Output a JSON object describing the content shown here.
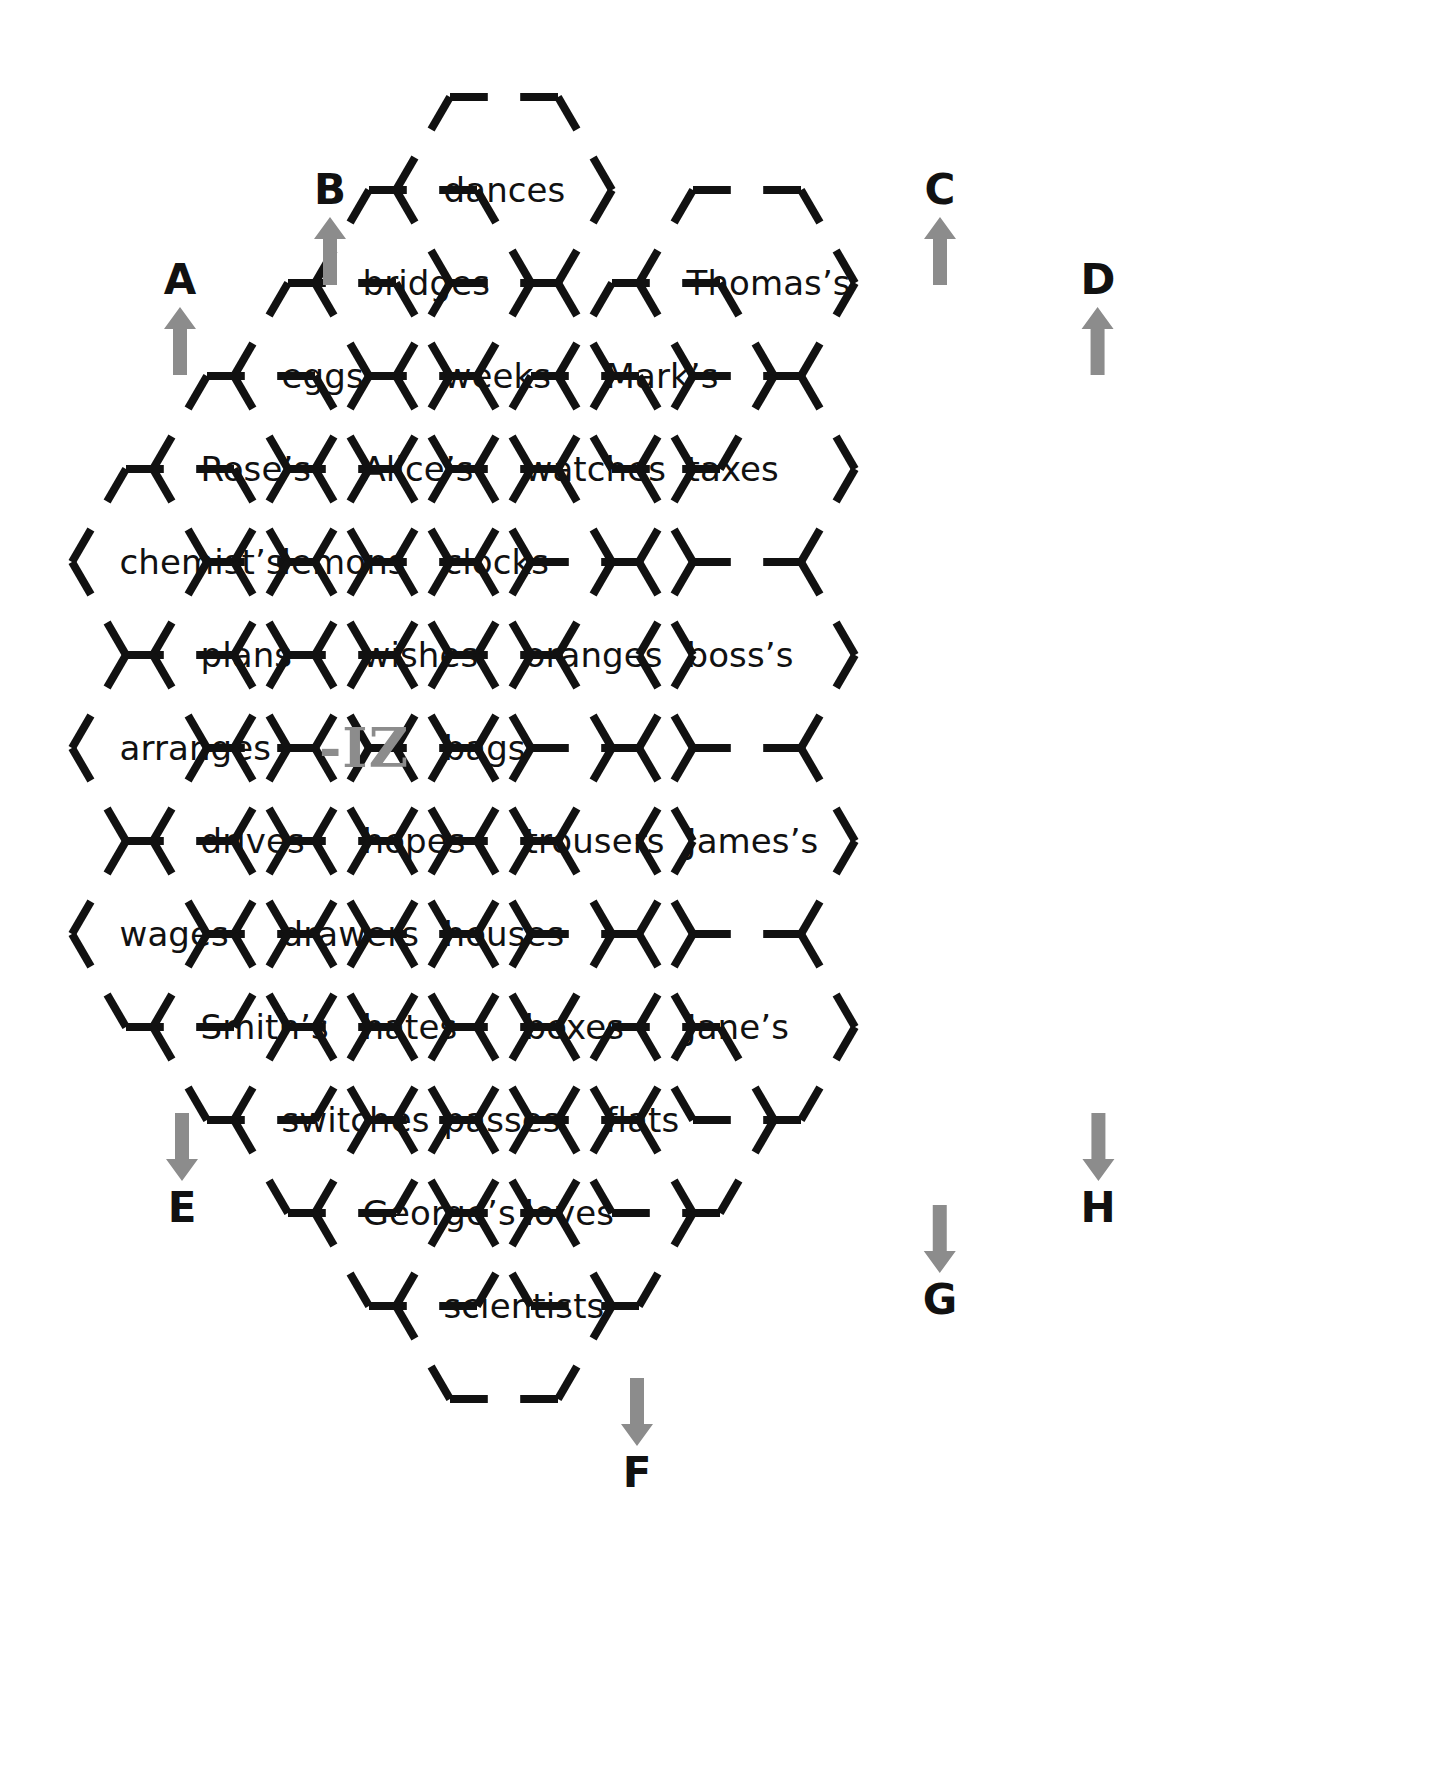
{
  "figure": {
    "kind": "honeycomb-word-puzzle",
    "center_label": "-IZ",
    "stroke_color": "#111111",
    "arrow_color": "#8c8c8c",
    "center_label_color": "#8c8c8c",
    "background_color": "#ffffff"
  },
  "cells": [
    {
      "id": "c-dances",
      "label": "dances",
      "col": 2,
      "row": 0
    },
    {
      "id": "c-bridges",
      "label": "bridges",
      "col": 1,
      "row": 1
    },
    {
      "id": "c-thomas",
      "label": "Thomas’s",
      "col": 3,
      "row": 1
    },
    {
      "id": "c-eggs",
      "label": "eggs",
      "col": 1,
      "row": 2
    },
    {
      "id": "c-weeks",
      "label": "weeks",
      "col": 2,
      "row": 2
    },
    {
      "id": "c-marks",
      "label": "Mark’s",
      "col": 3,
      "row": 2
    },
    {
      "id": "c-roses",
      "label": "Rose’s",
      "col": 0,
      "row": 3
    },
    {
      "id": "c-alices",
      "label": "Alice’s",
      "col": 1,
      "row": 3
    },
    {
      "id": "c-watches",
      "label": "watches",
      "col": 2,
      "row": 3
    },
    {
      "id": "c-taxes",
      "label": "taxes",
      "col": 3,
      "row": 3
    },
    {
      "id": "c-chemists",
      "label": "chemist’s",
      "col": 0,
      "row": 4
    },
    {
      "id": "c-lemons",
      "label": "lemons",
      "col": 1,
      "row": 4
    },
    {
      "id": "c-clocks",
      "label": "clocks",
      "col": 2,
      "row": 4
    },
    {
      "id": "c-plans",
      "label": "plans",
      "col": 0,
      "row": 5
    },
    {
      "id": "c-wishes",
      "label": "wishes",
      "col": 1,
      "row": 5
    },
    {
      "id": "c-oranges",
      "label": "oranges",
      "col": 2,
      "row": 5
    },
    {
      "id": "c-bosss",
      "label": "boss’s",
      "col": 3,
      "row": 5
    },
    {
      "id": "c-arranges",
      "label": "arranges",
      "col": 0,
      "row": 6
    },
    {
      "id": "c-iz",
      "label": "-IZ",
      "col": 1,
      "row": 6
    },
    {
      "id": "c-bags",
      "label": "bags",
      "col": 2,
      "row": 6
    },
    {
      "id": "c-drives",
      "label": "drives",
      "col": 0,
      "row": 7
    },
    {
      "id": "c-hopes",
      "label": "hopes",
      "col": 1,
      "row": 7
    },
    {
      "id": "c-trousers",
      "label": "trousers",
      "col": 2,
      "row": 7
    },
    {
      "id": "c-jamess",
      "label": "James’s",
      "col": 3,
      "row": 7
    },
    {
      "id": "c-wages",
      "label": "wages",
      "col": 0,
      "row": 8
    },
    {
      "id": "c-drawers",
      "label": "drawers",
      "col": 1,
      "row": 8
    },
    {
      "id": "c-houses",
      "label": "houses",
      "col": 2,
      "row": 8
    },
    {
      "id": "c-smiths",
      "label": "Smith’s",
      "col": 0,
      "row": 9
    },
    {
      "id": "c-hates",
      "label": "hates",
      "col": 1,
      "row": 9
    },
    {
      "id": "c-boxes",
      "label": "boxes",
      "col": 2,
      "row": 9
    },
    {
      "id": "c-janes",
      "label": "Jane’s",
      "col": 3,
      "row": 9
    },
    {
      "id": "c-switches",
      "label": "switches",
      "col": 1,
      "row": 10
    },
    {
      "id": "c-passes",
      "label": "passes",
      "col": 2,
      "row": 10
    },
    {
      "id": "c-flats",
      "label": "flats",
      "col": 3,
      "row": 10
    },
    {
      "id": "c-georges",
      "label": "George’s",
      "col": 1,
      "row": 11
    },
    {
      "id": "c-loves",
      "label": "loves",
      "col": 2,
      "row": 11
    },
    {
      "id": "c-scientists",
      "label": "scientists",
      "col": 2,
      "row": 12
    }
  ],
  "markers": [
    {
      "id": "m-a",
      "letter": "A",
      "direction": "up",
      "x": 180,
      "y": 318
    },
    {
      "id": "m-b",
      "letter": "B",
      "direction": "up",
      "x": 330,
      "y": 228
    },
    {
      "id": "m-c",
      "letter": "C",
      "direction": "up",
      "x": 940,
      "y": 228
    },
    {
      "id": "m-d",
      "letter": "D",
      "direction": "up",
      "x": 1098,
      "y": 318
    },
    {
      "id": "m-e",
      "letter": "E",
      "direction": "down",
      "x": 182,
      "y": 1170
    },
    {
      "id": "m-f",
      "letter": "F",
      "direction": "down",
      "x": 637,
      "y": 1435
    },
    {
      "id": "m-g",
      "letter": "G",
      "direction": "down",
      "x": 940,
      "y": 1262
    },
    {
      "id": "m-h",
      "letter": "H",
      "direction": "down",
      "x": 1098,
      "y": 1170
    }
  ],
  "geometry": {
    "hex_radius": 108,
    "col_step": 162,
    "row_step": 93,
    "origin_x": 180,
    "origin_y": 190,
    "gap_ratio": 0.3,
    "stroke_width": 8
  }
}
